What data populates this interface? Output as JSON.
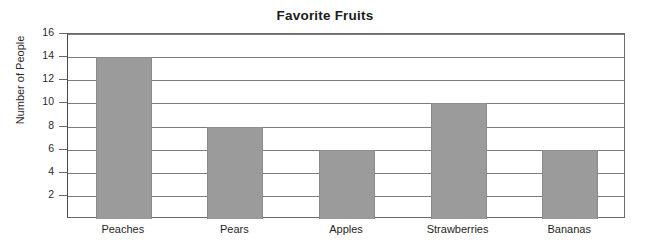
{
  "chart_data": {
    "type": "bar",
    "title": "Favorite Fruits",
    "xlabel": "",
    "ylabel": "Number of People",
    "categories": [
      "Peaches",
      "Pears",
      "Apples",
      "Strawberries",
      "Bananas"
    ],
    "values": [
      14,
      8,
      6,
      10,
      6
    ],
    "ylim": [
      0,
      16
    ],
    "ytick_values": [
      2,
      4,
      6,
      8,
      10,
      12,
      14,
      16
    ],
    "ytick_labels": [
      "2",
      "4",
      "6",
      "8",
      "10",
      "12",
      "14",
      "16"
    ],
    "grid": "horizontal",
    "legend": null,
    "bar_color": "#9b9b9b",
    "axis_color": "#6a6a6a",
    "background_color": "#ffffff"
  }
}
